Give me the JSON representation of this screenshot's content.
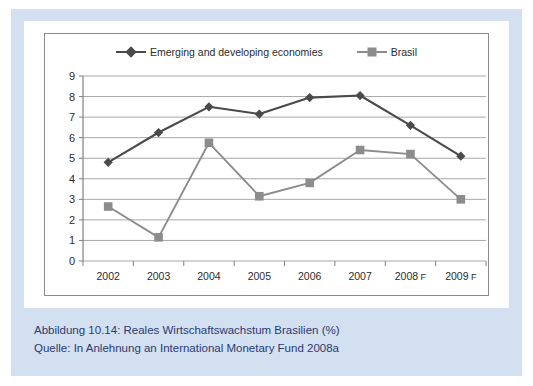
{
  "caption": {
    "line1": "Abbildung 10.14:  Reales Wirtschaftswachstum Brasilien (%)",
    "line2": "Quelle: In Anlehnung an International Monetary Fund 2008a"
  },
  "colors": {
    "series_emerging": "#4a4a4a",
    "series_brasil": "#8c8c8c",
    "gridline": "#a8a8a8",
    "axis": "#808080",
    "frame": "#8a8a8a",
    "outer_band": "#d3e0f2",
    "caption_text": "#2b3a70",
    "tick_text": "#2b2b2b"
  },
  "chart_data": {
    "type": "line",
    "title": "",
    "xlabel": "",
    "ylabel": "",
    "ylim": [
      0,
      9
    ],
    "yticks": [
      0,
      1,
      2,
      3,
      4,
      5,
      6,
      7,
      8,
      9
    ],
    "grid": true,
    "legend_position": "top-center",
    "categories": [
      "2002",
      "2003",
      "2004",
      "2005",
      "2006",
      "2007",
      "2008 F",
      "2009 F"
    ],
    "series": [
      {
        "name": "Emerging and developing economies",
        "marker": "diamond",
        "color": "#4a4a4a",
        "values": [
          4.8,
          6.25,
          7.5,
          7.15,
          7.95,
          8.05,
          6.6,
          5.1
        ]
      },
      {
        "name": "Brasil",
        "marker": "square",
        "color": "#8c8c8c",
        "values": [
          2.65,
          1.15,
          5.75,
          3.15,
          3.8,
          5.4,
          5.2,
          3.0
        ]
      }
    ]
  }
}
